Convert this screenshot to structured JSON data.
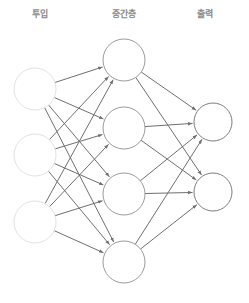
{
  "diagram": {
    "type": "neural-network",
    "title": "",
    "canvas": {
      "width": 249,
      "height": 303,
      "background": "#ffffff"
    },
    "labels": {
      "input": "투입",
      "hidden": "중간층",
      "output": "출력",
      "color": "#8a8a8a"
    },
    "label_positions": [
      {
        "key": "input",
        "x": 40,
        "y": 10
      },
      {
        "key": "hidden",
        "x": 124,
        "y": 10
      },
      {
        "key": "output",
        "x": 205,
        "y": 10
      }
    ],
    "layers": [
      {
        "name": "input",
        "label": "투입",
        "node_count": 3,
        "radius": 21,
        "stroke": "#e3e3e3",
        "fill": "#ffffff",
        "nodes": [
          {
            "id": "i1",
            "x": 35,
            "y": 89
          },
          {
            "id": "i2",
            "x": 35,
            "y": 155
          },
          {
            "id": "i3",
            "x": 35,
            "y": 222
          }
        ]
      },
      {
        "name": "hidden",
        "label": "중간층",
        "node_count": 4,
        "radius": 21,
        "stroke": "#9b9b9b",
        "fill": "#ffffff",
        "nodes": [
          {
            "id": "h1",
            "x": 124,
            "y": 60
          },
          {
            "id": "h2",
            "x": 124,
            "y": 128
          },
          {
            "id": "h3",
            "x": 124,
            "y": 194
          },
          {
            "id": "h4",
            "x": 124,
            "y": 262
          }
        ]
      },
      {
        "name": "output",
        "label": "출력",
        "node_count": 2,
        "radius": 19,
        "stroke": "#7d7d7d",
        "fill": "#ffffff",
        "nodes": [
          {
            "id": "o1",
            "x": 213,
            "y": 122
          },
          {
            "id": "o2",
            "x": 213,
            "y": 192
          }
        ]
      }
    ],
    "edges": {
      "style": {
        "stroke": "#6f6f6f",
        "width": 1,
        "arrowhead": true
      },
      "input_to_hidden": [
        [
          "i1",
          "h1"
        ],
        [
          "i1",
          "h2"
        ],
        [
          "i1",
          "h3"
        ],
        [
          "i1",
          "h4"
        ],
        [
          "i2",
          "h1"
        ],
        [
          "i2",
          "h2"
        ],
        [
          "i2",
          "h3"
        ],
        [
          "i2",
          "h4"
        ],
        [
          "i3",
          "h1"
        ],
        [
          "i3",
          "h2"
        ],
        [
          "i3",
          "h3"
        ],
        [
          "i3",
          "h4"
        ]
      ],
      "hidden_to_output": [
        [
          "h1",
          "o1"
        ],
        [
          "h1",
          "o2"
        ],
        [
          "h2",
          "o1"
        ],
        [
          "h2",
          "o2"
        ],
        [
          "h3",
          "o1"
        ],
        [
          "h3",
          "o2"
        ],
        [
          "h4",
          "o1"
        ],
        [
          "h4",
          "o2"
        ]
      ]
    }
  }
}
